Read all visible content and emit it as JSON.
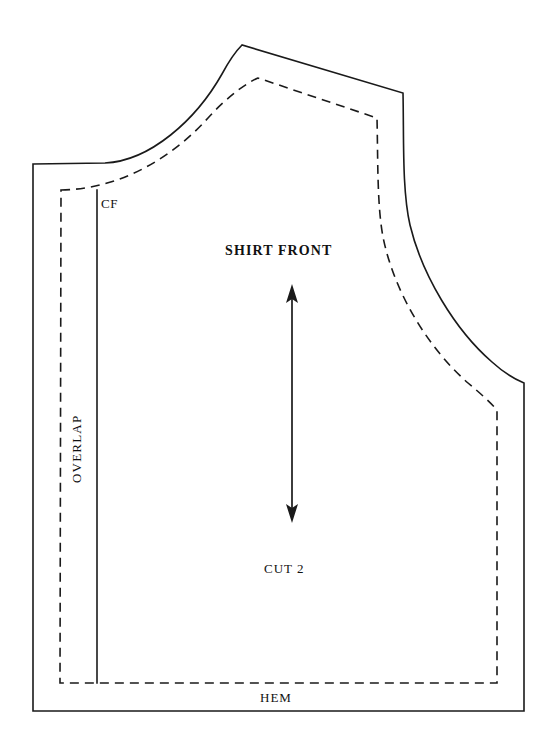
{
  "document": {
    "kind": "sewing-pattern-diagram",
    "piece_name": "SHIRT FRONT",
    "background_color": "#ffffff",
    "line_color": "#1a1a1a"
  },
  "labels": {
    "center_front": "CF",
    "piece_title": "SHIRT FRONT",
    "cut_quantity": "CUT 2",
    "hem": "HEM",
    "overlap": "OVERLAP"
  },
  "grainline": {
    "name": "grainline-arrow",
    "x": 292,
    "y_top": 285,
    "y_bottom": 522,
    "head_top": "up",
    "head_bottom": "down"
  },
  "outlines": {
    "cutting_line": {
      "style": "solid",
      "stroke_width": 1.6,
      "path": "M 33 164 L 105 163 C 150 161 196 120 222 74 C 229 61 236 51 242 45 L 403 93 C 404 140 402 190 410 225 C 422 275 455 330 492 362 C 503 372 514 379 524 383 L 524 711 L 33 711 Z"
    },
    "stitching_line": {
      "style": "dashed",
      "stroke_width": 1.6,
      "dash_pattern": "9 6",
      "path": "M 61 190 L 61 190 C 120 189 172 158 208 118 C 226 98 246 83 258 78 L 377 118 C 378 160 377 205 383 237 C 394 292 428 348 468 383 C 480 393 490 402 497 410 L 497 683 L 60 683 Z"
    },
    "center_front_line": {
      "style": "solid",
      "stroke_width": 1.6,
      "x": 97,
      "y_top": 190,
      "y_bottom": 683
    }
  }
}
